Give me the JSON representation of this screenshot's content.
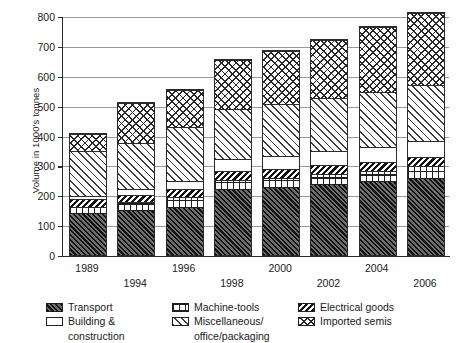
{
  "chart_data": {
    "type": "bar",
    "subtype": "stacked",
    "title": "",
    "xlabel": "",
    "ylabel": "Volume in 1000's tonnes",
    "ylim": [
      0,
      800
    ],
    "yticks": [
      0,
      100,
      200,
      300,
      400,
      500,
      600,
      700,
      800
    ],
    "ytick_labels": [
      "0",
      "100",
      "200",
      "300",
      "400",
      "500",
      "600",
      "700",
      "800"
    ],
    "grid": true,
    "legend_position": "below",
    "categories": [
      "1989",
      "1994",
      "1996",
      "1998",
      "2000",
      "2002",
      "2004",
      "2006"
    ],
    "series": [
      {
        "name": "Transport",
        "pattern": "dark-diagonal-hatch",
        "values": [
          140,
          150,
          160,
          220,
          225,
          235,
          245,
          255
        ]
      },
      {
        "name": "Machine-tools",
        "pattern": "grid-crosshatch",
        "values": [
          25,
          30,
          35,
          35,
          35,
          40,
          40,
          45
        ]
      },
      {
        "name": "Electrical goods",
        "pattern": "dense-diagonal-stripe",
        "values": [
          25,
          25,
          30,
          30,
          30,
          30,
          30,
          30
        ]
      },
      {
        "name": "Building & construction",
        "pattern": "white-empty",
        "values": [
          10,
          20,
          25,
          40,
          45,
          45,
          50,
          55
        ]
      },
      {
        "name": "Miscellaneous/ office/packaging",
        "pattern": "light-diagonal-hatch",
        "values": [
          155,
          155,
          185,
          170,
          175,
          180,
          185,
          190
        ]
      },
      {
        "name": "Imported semis",
        "pattern": "diamond-crosshatch",
        "values": [
          58,
          135,
          125,
          165,
          180,
          195,
          220,
          243
        ]
      }
    ],
    "totals": [
      413,
      515,
      560,
      660,
      690,
      725,
      770,
      818
    ]
  },
  "axis": {
    "y_title": "Volume in 1000's tonnes"
  },
  "legend": {
    "column1": [
      {
        "label": "Transport",
        "label2": "",
        "pattern": "dark-diagonal-hatch"
      },
      {
        "label": "Building &",
        "label2": "construction",
        "pattern": "white-empty"
      }
    ],
    "column2": [
      {
        "label": "Machine-tools",
        "label2": "",
        "pattern": "grid-crosshatch"
      },
      {
        "label": "Miscellaneous/",
        "label2": "office/packaging",
        "pattern": "light-diagonal-hatch"
      }
    ],
    "column3": [
      {
        "label": "Electrical goods",
        "label2": "",
        "pattern": "dense-diagonal-stripe"
      },
      {
        "label": "Imported semis",
        "label2": "",
        "pattern": "diamond-crosshatch"
      }
    ]
  }
}
